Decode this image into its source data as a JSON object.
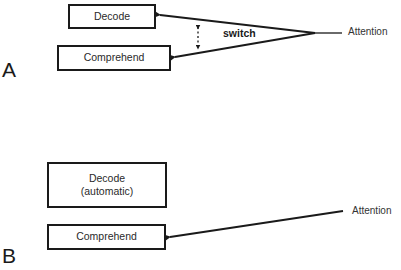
{
  "panels": {
    "a": {
      "letter": "A",
      "decode_box": {
        "label": "Decode"
      },
      "comprehend_box": {
        "label": "Comprehend"
      },
      "switch_label": "switch",
      "attention_label": "Attention"
    },
    "b": {
      "letter": "B",
      "decode_box": {
        "line1": "Decode",
        "line2": "(automatic)"
      },
      "comprehend_box": {
        "label": "Comprehend"
      },
      "attention_label": "Attention"
    }
  },
  "colors": {
    "ink": "#1a1a1a",
    "background": "#ffffff"
  }
}
